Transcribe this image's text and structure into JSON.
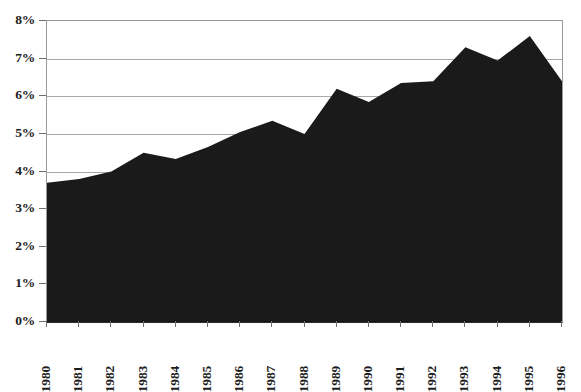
{
  "chart_data": {
    "type": "area",
    "title": "",
    "subtitle": "",
    "xlabel": "",
    "ylabel": "",
    "grid": true,
    "legend": false,
    "legend_position": "none",
    "series_color": "#1a1a1a",
    "grid_color": "#a8a8a8",
    "axis_color": "#2b2b2b",
    "categories": [
      "1980",
      "1981",
      "1982",
      "1983",
      "1984",
      "1985",
      "1986",
      "1987",
      "1988",
      "1989",
      "1990",
      "1991",
      "1992",
      "1993",
      "1994",
      "1995",
      "1996"
    ],
    "values": [
      3.7,
      3.8,
      4.0,
      4.5,
      4.33,
      4.65,
      5.05,
      5.35,
      5.0,
      6.2,
      5.85,
      6.35,
      6.4,
      7.3,
      6.95,
      7.6,
      6.4
    ],
    "ylim": [
      0,
      8
    ],
    "ytick_values": [
      0,
      1,
      2,
      3,
      4,
      5,
      6,
      7,
      8
    ],
    "ytick_labels": [
      "0%",
      "1%",
      "2%",
      "3%",
      "4%",
      "5%",
      "6%",
      "7%",
      "8%"
    ],
    "xtick_labels": [
      "1980",
      "1981",
      "1982",
      "1983",
      "1984",
      "1985",
      "1986",
      "1987",
      "1988",
      "1989",
      "1990",
      "1991",
      "1992",
      "1993",
      "1994",
      "1995",
      "1996"
    ],
    "annotations": []
  }
}
